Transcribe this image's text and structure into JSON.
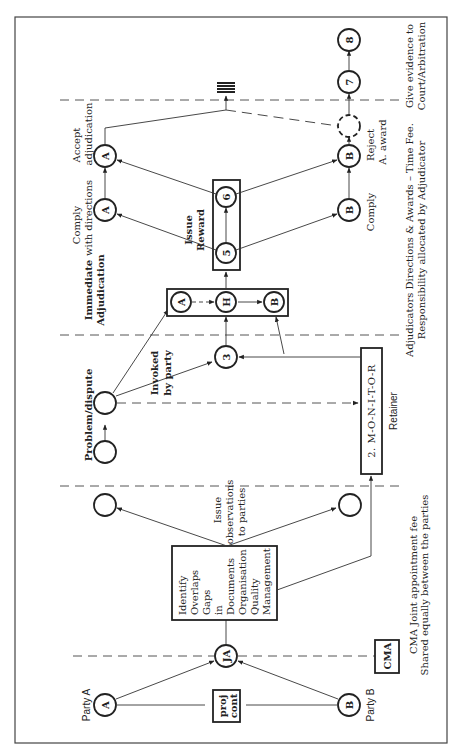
{
  "diagram": {
    "orientation": "rotated-90-ccw",
    "parties": {
      "party_a": {
        "label": "Party A",
        "node": "A"
      },
      "party_b": {
        "label": "Party B",
        "node": "B"
      }
    },
    "contract_box": {
      "line1": "proj",
      "line2": "cont"
    },
    "joint_appointment_node": "JA",
    "cma_box": "CMA",
    "cma_note": {
      "line1": "CMA Joint appointment fee",
      "line2": "Shared equally between the parties"
    },
    "identify_box": [
      "Identify",
      "Overlaps",
      "Gaps",
      "in",
      "Documents",
      "Organisation",
      "Quality",
      "Management"
    ],
    "issue_observations": {
      "line1": "Issue",
      "line2": "observations",
      "line3": "to parties"
    },
    "problem_dispute": "Problem/dispute",
    "invoked_by_party": {
      "line1": "Invoked",
      "line2": "by party"
    },
    "monitor_box": "2. M-O-N-I-T-O-R",
    "retainer": "Retainer",
    "node_3": "3",
    "immediate_adjudication": {
      "line1": "Immediate",
      "line2": "Adjudication"
    },
    "hearing_box": {
      "a": "A",
      "h": "H",
      "b": "B"
    },
    "issue_reward": {
      "line1": "Issue",
      "line2": "Reward"
    },
    "node_5": "5",
    "node_6": "6",
    "comply_directions": {
      "line1": "Comply",
      "line2": "with directions",
      "node": "A"
    },
    "accept_adjudication": {
      "line1": "Accept",
      "line2": "adjudication",
      "node": "A"
    },
    "comply_b": {
      "label": "Comply",
      "node": "B"
    },
    "reject_award": {
      "line1": "Reject",
      "line2": "A. award",
      "node": "B"
    },
    "node_7": "7",
    "node_8": "8",
    "adjudicator_note": {
      "line1": "Adjudicators Directions & Awards – Time Fee.",
      "line2": "Responsibility allocated by Adjudicator"
    },
    "court_note": {
      "line1": "Give evidence to",
      "line2": "Court/Arbitration"
    }
  }
}
